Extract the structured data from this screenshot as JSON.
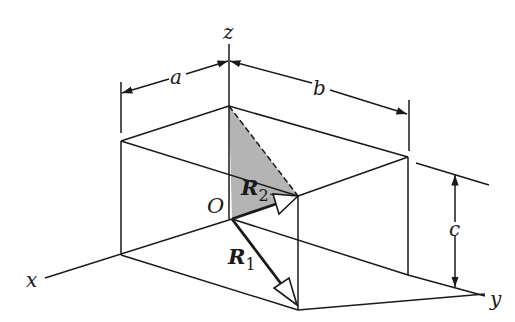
{
  "diagram": {
    "type": "3d-rectangular-box-with-position-vectors",
    "labels": {
      "z_axis": "z",
      "x_axis": "x",
      "y_axis": "y",
      "origin": "O",
      "dim_a": "a",
      "dim_b": "b",
      "dim_c": "c",
      "vector_1": "R",
      "vector_1_sub": "1",
      "vector_2": "R",
      "vector_2_sub": "2"
    },
    "colors": {
      "line": "#1a1a1a",
      "shaded_triangle": "#b4b4b4",
      "background": "#ffffff"
    }
  }
}
